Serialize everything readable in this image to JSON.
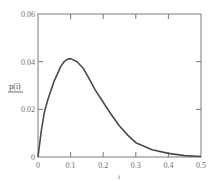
{
  "chart_data": {
    "type": "line",
    "title": "",
    "xlabel": "i",
    "ylabel": "p(i)",
    "xlim": [
      0,
      0.5
    ],
    "ylim": [
      0,
      0.06
    ],
    "grid": false,
    "legend": null,
    "x_ticks": [
      "0",
      "0.1",
      "0.2",
      "0.3",
      "0.4",
      "0.5"
    ],
    "y_ticks": [
      "0",
      "0.02",
      "0.04",
      "0.06"
    ],
    "series": [
      {
        "name": "p(i)",
        "color": "#4a4a4a",
        "x": [
          0,
          0.01,
          0.02,
          0.03,
          0.04,
          0.05,
          0.06,
          0.07,
          0.08,
          0.09,
          0.1,
          0.12,
          0.14,
          0.16,
          0.175,
          0.2,
          0.225,
          0.25,
          0.275,
          0.3,
          0.35,
          0.4,
          0.45,
          0.5
        ],
        "y": [
          0,
          0.011,
          0.019,
          0.024,
          0.028,
          0.032,
          0.035,
          0.038,
          0.04,
          0.041,
          0.0413,
          0.04,
          0.037,
          0.032,
          0.0283,
          0.023,
          0.0177,
          0.013,
          0.0092,
          0.006,
          0.003,
          0.0015,
          0.0006,
          0.0002
        ]
      }
    ]
  }
}
